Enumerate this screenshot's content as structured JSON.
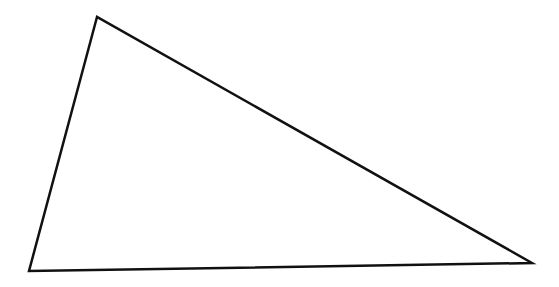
{
  "diagram": {
    "shape": "triangle",
    "stroke_color": "#111111",
    "fill_color": "#ffffff",
    "stroke_width": 2.5,
    "vertices": [
      {
        "x": 97,
        "y": 17
      },
      {
        "x": 29,
        "y": 271
      },
      {
        "x": 532,
        "y": 263
      }
    ]
  }
}
